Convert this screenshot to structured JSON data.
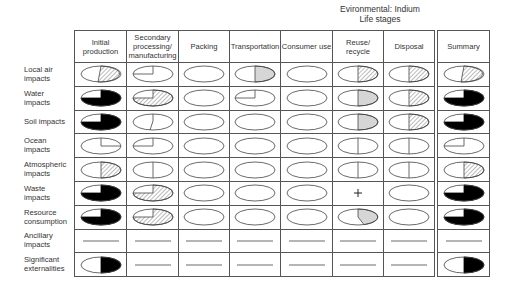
{
  "title": {
    "line1": "Evironmental: Indium",
    "line2": "Life stages"
  },
  "columns": [
    {
      "label": "Initial production"
    },
    {
      "label": "Secondary processing/ manufacturing"
    },
    {
      "label": "Packing"
    },
    {
      "label": "Transportation"
    },
    {
      "label": "Consumer use"
    },
    {
      "label": "Reuse/ recycle"
    },
    {
      "label": "Disposal"
    }
  ],
  "summary_column": {
    "label": "Summary"
  },
  "rows": [
    {
      "label": "Local air impacts",
      "cells": [
        "right-hatch-slant",
        "quarter-outline",
        "empty",
        "right-half-gray",
        "empty",
        "right-half-hatch",
        "right-half-hatch"
      ],
      "summary": "right-hatch-slant"
    },
    {
      "label": "Water impacts",
      "cells": [
        "three-quarter-black",
        "three-quarter-hatch",
        "empty",
        "quarter-outline",
        "empty",
        "right-half-gray",
        "right-half-hatch"
      ],
      "summary": "three-quarter-black"
    },
    {
      "label": "Soil impacts",
      "cells": [
        "three-quarter-black",
        "slant-outline",
        "empty",
        "empty",
        "empty",
        "right-half-gray",
        "right-half-hatch"
      ],
      "summary": "three-quarter-black"
    },
    {
      "label": "Ocean impacts",
      "cells": [
        "quarter-outline-right",
        "quarter-outline",
        "empty",
        "empty",
        "empty",
        "half-line",
        "half-line"
      ],
      "summary": "quarter-outline"
    },
    {
      "label": "Atmospheric impacts",
      "cells": [
        "right-half-hatch",
        "half-line",
        "empty",
        "empty",
        "empty",
        "half-line",
        "half-line"
      ],
      "summary": "right-half-hatch"
    },
    {
      "label": "Waste impacts",
      "cells": [
        "three-quarter-black",
        "three-quarter-hatch",
        "empty",
        "empty",
        "empty",
        "plus",
        "empty"
      ],
      "summary": "three-quarter-black"
    },
    {
      "label": "Resource consumption",
      "cells": [
        "three-quarter-black",
        "three-quarter-hatch",
        "empty",
        "empty",
        "empty",
        "slice-gray",
        "empty"
      ],
      "summary": "three-quarter-black"
    },
    {
      "label": "Ancillary impacts",
      "cells": [
        "dash",
        "dash",
        "dash",
        "dash",
        "dash",
        "dash",
        "dash"
      ],
      "summary": "dash"
    },
    {
      "label": "Significant externalities",
      "cells": [
        "right-half-black",
        "dash",
        "dash",
        "dash",
        "dash",
        "dash",
        "dash"
      ],
      "summary": "right-half-black"
    }
  ],
  "colors": {
    "stroke": "#444444",
    "black_fill": "#000000",
    "gray_fill": "#d6d6d6",
    "hatch": "#555555"
  }
}
